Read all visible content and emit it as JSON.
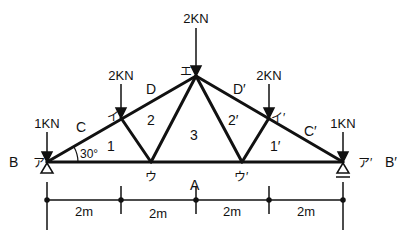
{
  "diagram": {
    "type": "roof truss",
    "nodes": {
      "left_support": "ア",
      "right_support": "ア′",
      "upper_left": "イ",
      "upper_right": "イ′",
      "apex": "エ",
      "lower_left": "ウ",
      "lower_right": "ウ′"
    },
    "loads": {
      "left_support": "1KN",
      "upper_left": "2KN",
      "apex": "2KN",
      "upper_right": "2KN",
      "right_support": "1KN"
    },
    "region_labels": {
      "B": "B",
      "B_prime": "B′",
      "C": "C",
      "C_prime": "C′",
      "D": "D",
      "D_prime": "D′",
      "A": "A",
      "r1": "1",
      "r2": "2",
      "r3": "3",
      "r1_prime": "1′",
      "r2_prime": "2′"
    },
    "angle": "30°",
    "dimensions": [
      "2m",
      "2m",
      "2m",
      "2m"
    ]
  }
}
